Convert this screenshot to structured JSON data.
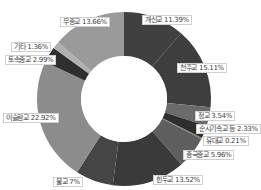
{
  "chart_data": {
    "type": "pie",
    "variant": "donut",
    "title": "",
    "start_angle_deg": 0,
    "direction": "clockwise",
    "categories": [
      "개신교",
      "천주교",
      "정교",
      "순시기속교 등",
      "유대교",
      "중국종교",
      "힌두교",
      "불교",
      "이슬람교",
      "토속종교",
      "기타",
      "무종교"
    ],
    "values": [
      11.39,
      15.11,
      3.54,
      2.33,
      0.21,
      5.96,
      13.52,
      7,
      22.92,
      2.99,
      1.36,
      13.66
    ],
    "colors": [
      "#404040",
      "#3e3e3e",
      "#6b6b6b",
      "#2e2e2e",
      "#7a7a7a",
      "#5e5e5e",
      "#3a3a3a",
      "#454545",
      "#8c8c8c",
      "#2f2f2f",
      "#b0b0b0",
      "#9a9a9a"
    ],
    "labels": [
      {
        "text": "개신교 11.39%",
        "x": 142,
        "y": 15
      },
      {
        "text": "천주교 15.11%",
        "x": 177,
        "y": 63
      },
      {
        "text": "정교 3.54%",
        "x": 195,
        "y": 111
      },
      {
        "text": "순시기속교 등 2.33%",
        "x": 196,
        "y": 124
      },
      {
        "text": "유대교 0.21%",
        "x": 203,
        "y": 136
      },
      {
        "text": "중국종교 5.96%",
        "x": 183,
        "y": 150
      },
      {
        "text": "힌두교 13.52%",
        "x": 153,
        "y": 175
      },
      {
        "text": "불교 7%",
        "x": 53,
        "y": 177
      },
      {
        "text": "이슬람교 22.92%",
        "x": 3,
        "y": 113
      },
      {
        "text": "토속종교 2.99%",
        "x": 5,
        "y": 55
      },
      {
        "text": "기타 1.36%",
        "x": 11,
        "y": 42
      },
      {
        "text": "무종교 13.66%",
        "x": 60,
        "y": 17
      }
    ],
    "center": [
      124,
      99
    ],
    "outer_radius": 87,
    "inner_radius": 43,
    "legend": "none"
  }
}
